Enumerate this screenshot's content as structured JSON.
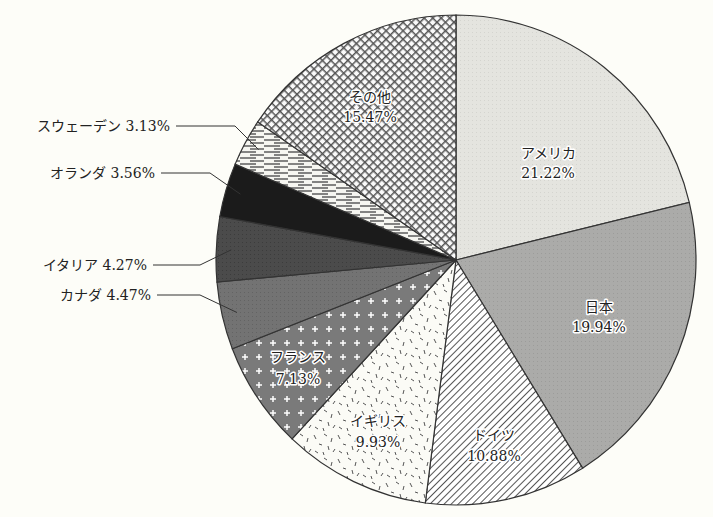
{
  "chart_data": {
    "type": "pie",
    "title": "",
    "start_angle": "12 o'clock",
    "direction": "clockwise",
    "categories": [
      "アメリカ",
      "日本",
      "ドイツ",
      "イギリス",
      "フランス",
      "カナダ",
      "イタリア",
      "オランダ",
      "スウェーデン",
      "その他"
    ],
    "values": [
      21.22,
      19.94,
      10.88,
      9.93,
      7.13,
      4.47,
      4.27,
      3.56,
      3.13,
      15.47
    ],
    "value_labels": [
      "21.22%",
      "19.94%",
      "10.88%",
      "9.93%",
      "7.13%",
      "4.47%",
      "4.27%",
      "3.56%",
      "3.13%",
      "15.47%"
    ],
    "slices": [
      {
        "name": "アメリカ",
        "value": 21.22,
        "label": "21.22%",
        "fill": "#e6e6e1",
        "pattern": "light-gray",
        "label_position": "inside"
      },
      {
        "name": "日本",
        "value": 19.94,
        "label": "19.94%",
        "fill": "#a9a9a7",
        "pattern": "mid-gray",
        "label_position": "inside"
      },
      {
        "name": "ドイツ",
        "value": 10.88,
        "label": "10.88%",
        "fill": "#ffffff",
        "pattern": "diagonal-hatch",
        "label_position": "inside"
      },
      {
        "name": "イギリス",
        "value": 9.93,
        "label": "9.93%",
        "fill": "#ffffff",
        "pattern": "dash-speckle",
        "label_position": "inside"
      },
      {
        "name": "フランス",
        "value": 7.13,
        "label": "7.13%",
        "fill": "#7c7c7c",
        "pattern": "white-crosses",
        "label_position": "inside"
      },
      {
        "name": "カナダ",
        "value": 4.47,
        "label": "4.47%",
        "fill": "#707070",
        "pattern": "dark-gray",
        "label_position": "outside"
      },
      {
        "name": "イタリア",
        "value": 4.27,
        "label": "4.27%",
        "fill": "#4a4a4a",
        "pattern": "darker-gray",
        "label_position": "outside"
      },
      {
        "name": "オランダ",
        "value": 3.56,
        "label": "3.56%",
        "fill": "#1c1c1c",
        "pattern": "black",
        "label_position": "outside"
      },
      {
        "name": "スウェーデン",
        "value": 3.13,
        "label": "3.13%",
        "fill": "#ffffff",
        "pattern": "horizontal-dashes",
        "label_position": "outside"
      },
      {
        "name": "その他",
        "value": 15.47,
        "label": "15.47%",
        "fill": "#5a5a5a",
        "pattern": "crosshatch",
        "label_position": "inside"
      }
    ],
    "legend": "none",
    "grid": false
  },
  "labels": {
    "america": {
      "name": "アメリカ",
      "pct": "21.22%"
    },
    "japan": {
      "name": "日本",
      "pct": "19.94%"
    },
    "germany": {
      "name": "ドイツ",
      "pct": "10.88%"
    },
    "uk": {
      "name": "イギリス",
      "pct": "9.93%"
    },
    "france": {
      "name": "フランス",
      "pct": "7.13%"
    },
    "canada": {
      "text": "カナダ  4.47%"
    },
    "italy": {
      "text": "イタリア  4.27%"
    },
    "netherlands": {
      "text": "オランダ  3.56%"
    },
    "sweden": {
      "text": "スウェーデン  3.13%"
    },
    "others": {
      "name": "その他",
      "pct": "15.47%"
    }
  }
}
